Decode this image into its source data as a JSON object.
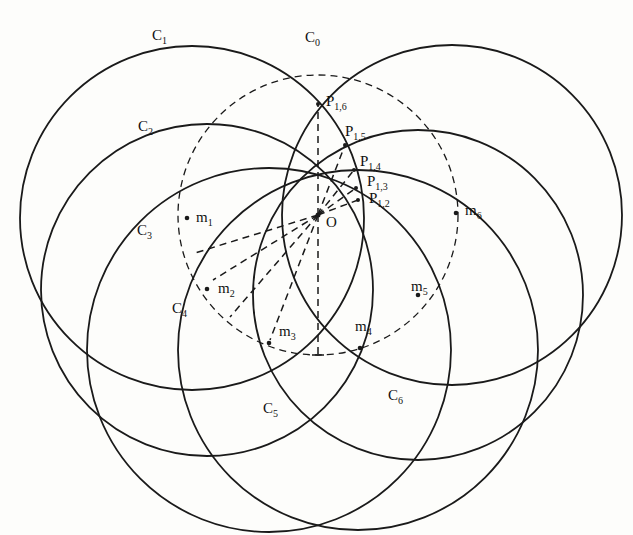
{
  "diagram": {
    "stroke_color": "#1a1a1a",
    "background": "#fdfdfb",
    "center": {
      "name": "O",
      "x": 318,
      "y": 215
    },
    "reference_circle": {
      "name": "C0",
      "sub": "0",
      "cx": 318,
      "cy": 215,
      "r": 140,
      "style": "dashed",
      "label_x": 305,
      "label_y": 42
    },
    "circles": [
      {
        "name": "C1",
        "sub": "1",
        "cx": 192,
        "cy": 218,
        "r": 172,
        "label_x": 152,
        "label_y": 40
      },
      {
        "name": "C2",
        "sub": "2",
        "cx": 207,
        "cy": 290,
        "r": 166,
        "label_x": 138,
        "label_y": 131
      },
      {
        "name": "C3",
        "sub": "3",
        "cx": 269,
        "cy": 350,
        "r": 182,
        "label_x": 137,
        "label_y": 235
      },
      {
        "name": "C4",
        "sub": "4",
        "cx": 358,
        "cy": 350,
        "r": 180,
        "label_x": 172,
        "label_y": 313
      },
      {
        "name": "C5",
        "sub": "5",
        "cx": 418,
        "cy": 295,
        "r": 165,
        "label_x": 263,
        "label_y": 413
      },
      {
        "name": "C6",
        "sub": "6",
        "cx": 452,
        "cy": 215,
        "r": 170,
        "label_x": 388,
        "label_y": 400
      }
    ],
    "centers": [
      {
        "name": "m1",
        "sub": "1",
        "x": 187,
        "y": 218,
        "label_x": 196,
        "label_y": 222
      },
      {
        "name": "m2",
        "sub": "2",
        "x": 207,
        "y": 289,
        "label_x": 218,
        "label_y": 293
      },
      {
        "name": "m3",
        "sub": "3",
        "x": 269,
        "y": 343,
        "label_x": 279,
        "label_y": 336
      },
      {
        "name": "m4",
        "sub": "4",
        "x": 360,
        "y": 348,
        "label_x": 355,
        "label_y": 331
      },
      {
        "name": "m5",
        "sub": "5",
        "x": 418,
        "y": 295,
        "label_x": 411,
        "label_y": 291
      },
      {
        "name": "m6",
        "sub": "6",
        "x": 456,
        "y": 213,
        "label_x": 465,
        "label_y": 215
      }
    ],
    "intersection_points": [
      {
        "name": "P1,6",
        "sub": "1,6",
        "x": 318,
        "y": 104,
        "label_x": 326,
        "label_y": 106
      },
      {
        "name": "P1,5",
        "sub": "1,5",
        "x": 345,
        "y": 145,
        "label_x": 345,
        "label_y": 136
      },
      {
        "name": "P1,4",
        "sub": "1,4",
        "x": 354,
        "y": 170,
        "label_x": 360,
        "label_y": 166
      },
      {
        "name": "P1,3",
        "sub": "1,3",
        "x": 356,
        "y": 188,
        "label_x": 367,
        "label_y": 186
      },
      {
        "name": "P1,2",
        "sub": "1,2",
        "x": 358,
        "y": 200,
        "label_x": 369,
        "label_y": 203
      }
    ],
    "dashed_segments": [
      {
        "from": "O",
        "x1": 318,
        "y1": 215,
        "x2": 318,
        "y2": 104
      },
      {
        "from": "O",
        "x1": 318,
        "y1": 215,
        "x2": 345,
        "y2": 145
      },
      {
        "from": "O",
        "x1": 318,
        "y1": 215,
        "x2": 354,
        "y2": 170
      },
      {
        "from": "O",
        "x1": 318,
        "y1": 215,
        "x2": 356,
        "y2": 188
      },
      {
        "from": "O",
        "x1": 318,
        "y1": 215,
        "x2": 358,
        "y2": 200
      },
      {
        "from": "O",
        "x1": 318,
        "y1": 215,
        "x2": 195,
        "y2": 253
      },
      {
        "from": "O",
        "x1": 318,
        "y1": 215,
        "x2": 213,
        "y2": 280
      },
      {
        "from": "O",
        "x1": 318,
        "y1": 215,
        "x2": 230,
        "y2": 317
      },
      {
        "from": "O",
        "x1": 318,
        "y1": 215,
        "x2": 270,
        "y2": 340
      },
      {
        "from": "O",
        "x1": 318,
        "y1": 215,
        "x2": 318,
        "y2": 355
      }
    ],
    "tick": {
      "x1": 312,
      "y1": 355,
      "x2": 324,
      "y2": 355
    }
  }
}
